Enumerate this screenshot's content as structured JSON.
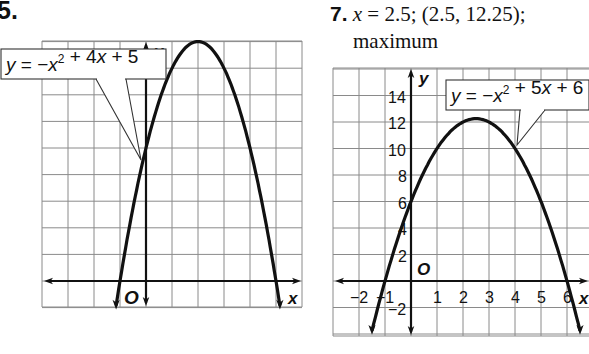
{
  "problems": [
    {
      "number": "5.",
      "equation_label": "y = −x² + 4x + 5"
    },
    {
      "number": "7.",
      "answer_var": "x",
      "answer_line1": " = 2.5; (2.5, 12.25);",
      "answer_line2": "maximum",
      "equation_label": "y = −x² + 5x + 6"
    }
  ],
  "chart_data": [
    {
      "type": "line",
      "title": "5.",
      "series": [
        {
          "name": "y = -x^2 + 4x + 5",
          "equation": "-x^2+4x+5",
          "x": [
            -1.15,
            -1,
            0,
            1,
            2,
            3,
            4,
            5,
            5.15
          ],
          "values": [
            -0.93,
            0,
            5,
            8,
            9,
            8,
            5,
            0,
            -0.93
          ]
        }
      ],
      "xlabel": "x",
      "ylabel": "y",
      "xlim": [
        -4,
        6
      ],
      "ylim": [
        -1,
        9
      ],
      "grid": true,
      "origin_label": "O",
      "annotation": "y = −x² + 4x + 5",
      "tick_labels_x": [],
      "tick_labels_y": []
    },
    {
      "type": "line",
      "title": "7.",
      "series": [
        {
          "name": "y = -x^2 + 5x + 6",
          "equation": "-x^2+5x+6",
          "x": [
            -1.5,
            -1,
            0,
            1,
            2,
            2.5,
            3,
            4,
            5,
            6,
            6.5
          ],
          "values": [
            -3.75,
            0,
            6,
            10,
            12,
            12.25,
            12,
            10,
            6,
            0,
            -3.75
          ]
        }
      ],
      "xlabel": "x",
      "ylabel": "y",
      "xlim": [
        -3,
        7
      ],
      "ylim": [
        -4,
        16
      ],
      "grid": true,
      "origin_label": "O",
      "annotation": "y = −x² + 5x + 6",
      "tick_labels_x": [
        "−2",
        "−1",
        "1",
        "2",
        "3",
        "4",
        "5",
        "6"
      ],
      "tick_labels_y": [
        "14",
        "12",
        "10",
        "8",
        "6",
        "4",
        "2",
        "−2"
      ],
      "vertex": [
        2.5,
        12.25
      ],
      "axis_of_symmetry": "x = 2.5",
      "extremum": "maximum"
    }
  ]
}
